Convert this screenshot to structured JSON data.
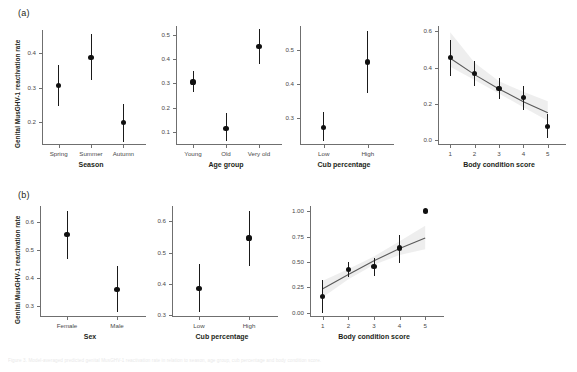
{
  "figure": {
    "y_axis_label": "Genital MusGHV-1 reactivation rate",
    "caption": "Figure 3. Model-averaged predicted genital MusGHV-1 reactivation rate in relation to season, age group, cub percentage and body condition score."
  },
  "panels": {
    "a": {
      "tag": "(a)",
      "charts": [
        {
          "id": "a-season",
          "type": "scatter",
          "xlabel": "Season",
          "ylabel": "Genital MusGHV-1 reactivation rate",
          "categories": [
            "Spring",
            "Summer",
            "Autumn"
          ],
          "values": [
            0.305,
            0.388,
            0.198
          ],
          "ci_low": [
            0.245,
            0.322,
            0.142
          ],
          "ci_high": [
            0.365,
            0.455,
            0.253
          ],
          "yticks": [
            0.2,
            0.3,
            0.4
          ],
          "ytick_labels": [
            "0.2",
            "0.3",
            "0.4"
          ],
          "ylim": [
            0.135,
            0.468
          ]
        },
        {
          "id": "a-age",
          "type": "scatter",
          "xlabel": "Age group",
          "ylabel": "",
          "categories": [
            "Young",
            "Old",
            "Very old"
          ],
          "values": [
            0.305,
            0.115,
            0.452
          ],
          "ci_low": [
            0.262,
            0.062,
            0.378
          ],
          "ci_high": [
            0.352,
            0.178,
            0.522
          ],
          "yticks": [
            0.1,
            0.2,
            0.3,
            0.4,
            0.5
          ],
          "ytick_labels": [
            "0.1",
            "0.2",
            "0.3",
            "0.4",
            "0.5"
          ],
          "ylim": [
            0.05,
            0.535
          ]
        },
        {
          "id": "a-cub",
          "type": "scatter",
          "xlabel": "Cub percentage",
          "ylabel": "",
          "categories": [
            "Low",
            "High"
          ],
          "values": [
            0.272,
            0.465
          ],
          "ci_low": [
            0.232,
            0.372
          ],
          "ci_high": [
            0.318,
            0.558
          ],
          "yticks": [
            0.3,
            0.4,
            0.5
          ],
          "ytick_labels": [
            "0.3",
            "0.4",
            "0.5"
          ],
          "ylim": [
            0.222,
            0.572
          ]
        },
        {
          "id": "a-bcs",
          "type": "scatter",
          "xlabel": "Body condition score",
          "ylabel": "",
          "categories": [
            "1",
            "2",
            "3",
            "4",
            "5"
          ],
          "x": [
            1,
            2,
            3,
            4,
            5
          ],
          "values": [
            0.455,
            0.368,
            0.285,
            0.235,
            0.078
          ],
          "ci_low": [
            0.355,
            0.298,
            0.228,
            0.168,
            0.012
          ],
          "ci_high": [
            0.552,
            0.438,
            0.342,
            0.302,
            0.145
          ],
          "trend": {
            "x": [
              1,
              2,
              3,
              4,
              5
            ],
            "y": [
              0.452,
              0.362,
              0.283,
              0.213,
              0.152
            ],
            "band_low": [
              0.405,
              0.332,
              0.258,
              0.182,
              0.108
            ],
            "band_high": [
              0.595,
              0.428,
              0.325,
              0.268,
              0.215
            ]
          },
          "yticks": [
            0.0,
            0.2,
            0.4,
            0.6
          ],
          "ytick_labels": [
            "0.0",
            "0.2",
            "0.4",
            "0.6"
          ],
          "ylim": [
            -0.02,
            0.63
          ]
        }
      ]
    },
    "b": {
      "tag": "(b)",
      "charts": [
        {
          "id": "b-sex",
          "type": "scatter",
          "xlabel": "Sex",
          "ylabel": "Genital MusGHV-1 reactivation rate",
          "categories": [
            "Female",
            "Male"
          ],
          "values": [
            0.555,
            0.36
          ],
          "ci_low": [
            0.468,
            0.278
          ],
          "ci_high": [
            0.638,
            0.442
          ],
          "yticks": [
            0.3,
            0.4,
            0.5,
            0.6
          ],
          "ytick_labels": [
            "0.3",
            "0.4",
            "0.5",
            "0.6"
          ],
          "ylim": [
            0.265,
            0.655
          ]
        },
        {
          "id": "b-cub",
          "type": "scatter",
          "xlabel": "Cub percentage",
          "ylabel": "",
          "categories": [
            "Low",
            "High"
          ],
          "values": [
            0.385,
            0.546
          ],
          "ci_low": [
            0.312,
            0.458
          ],
          "ci_high": [
            0.465,
            0.632
          ],
          "yticks": [
            0.3,
            0.4,
            0.5,
            0.6
          ],
          "ytick_labels": [
            "0.3",
            "0.4",
            "0.5",
            "0.6"
          ],
          "ylim": [
            0.298,
            0.648
          ]
        },
        {
          "id": "b-bcs",
          "type": "scatter",
          "xlabel": "Body condition score",
          "ylabel": "",
          "categories": [
            "1",
            "2",
            "3",
            "4",
            "5"
          ],
          "x": [
            1,
            2,
            3,
            4,
            5
          ],
          "values": [
            0.165,
            0.425,
            0.458,
            0.638,
            1.0
          ],
          "ci_low": [
            0.0,
            0.352,
            0.362,
            0.492,
            null
          ],
          "ci_high": [
            0.325,
            0.5,
            0.538,
            0.765,
            null
          ],
          "trend": {
            "x": [
              1,
              2,
              3,
              4,
              5
            ],
            "y": [
              0.238,
              0.378,
              0.512,
              0.632,
              0.735
            ],
            "band_low": [
              0.155,
              0.332,
              0.472,
              0.568,
              0.625
            ],
            "band_high": [
              0.315,
              0.432,
              0.555,
              0.705,
              0.855
            ]
          },
          "yticks": [
            0.0,
            0.25,
            0.5,
            0.75,
            1.0
          ],
          "ytick_labels": [
            "0.00",
            "0.25",
            "0.50",
            "0.75",
            "1.00"
          ],
          "ylim": [
            -0.03,
            1.05
          ]
        }
      ]
    }
  },
  "style": {
    "point_color": "#101010",
    "line_color": "#595959",
    "band_color": "#e8e8e8",
    "axis_color": "#6f6f6f"
  }
}
